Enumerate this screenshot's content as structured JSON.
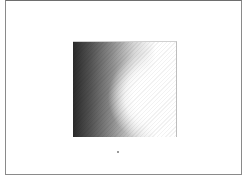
{
  "page": {
    "frame": {
      "border_color": "#8a8a8a"
    },
    "image": {
      "description": "square grayscale gradient, dark at left fading to white at right-center"
    },
    "marker": {
      "description": "small dot below image"
    }
  }
}
